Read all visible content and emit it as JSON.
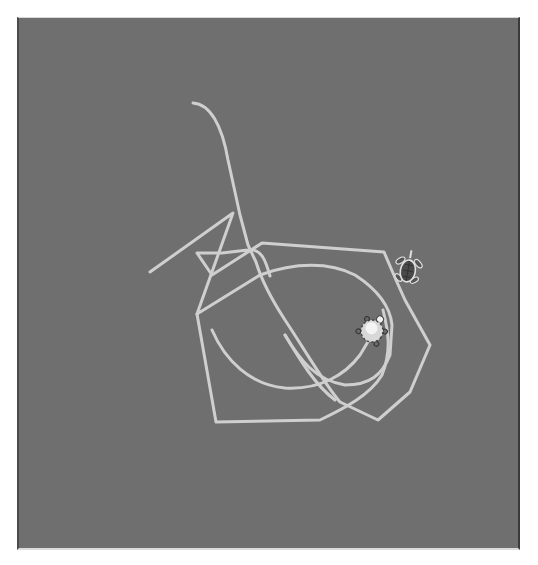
{
  "canvas": {
    "background": "#6f6f6f",
    "line_color": "#cfcfcf",
    "line_width": 3
  },
  "paths": [
    {
      "name": "path-a",
      "d": "M193,103 C210,104 222,125 228,160 L240,215 L248,245 L256,262 C262,282 272,300 285,320 C305,350 325,385 340,402 L378,420 L410,392 L430,345 L405,300 L396,280 L384,252 L262,243 L212,275 L197,253 L222,253 L248,250 C262,248 266,262 270,276"
    },
    {
      "name": "path-b",
      "d": "M150,272 L233,213 L197,314 L216,422 L320,420 C345,408 370,395 382,375 C392,350 388,330 383,310"
    },
    {
      "name": "path-c",
      "d": "M197,314 L260,275 C295,262 330,262 355,275 C375,288 390,305 392,325 L390,355 C382,375 370,385 345,385 C315,380 300,360 285,335"
    },
    {
      "name": "path-d",
      "d": "M212,330 C225,360 250,385 285,388 C320,390 345,375 360,355 L372,335"
    },
    {
      "name": "path-e",
      "d": "M285,335 C300,360 315,385 335,400"
    }
  ],
  "turtles": [
    {
      "name": "turtle-dark",
      "x": 408,
      "y": 270,
      "rotation": 10,
      "shell": "#4d4d4d",
      "outline": "#e0e0e0"
    },
    {
      "name": "turtle-light",
      "x": 372,
      "y": 331,
      "rotation": 35,
      "shell": "#e6e6e6",
      "outline": "#444444"
    }
  ]
}
